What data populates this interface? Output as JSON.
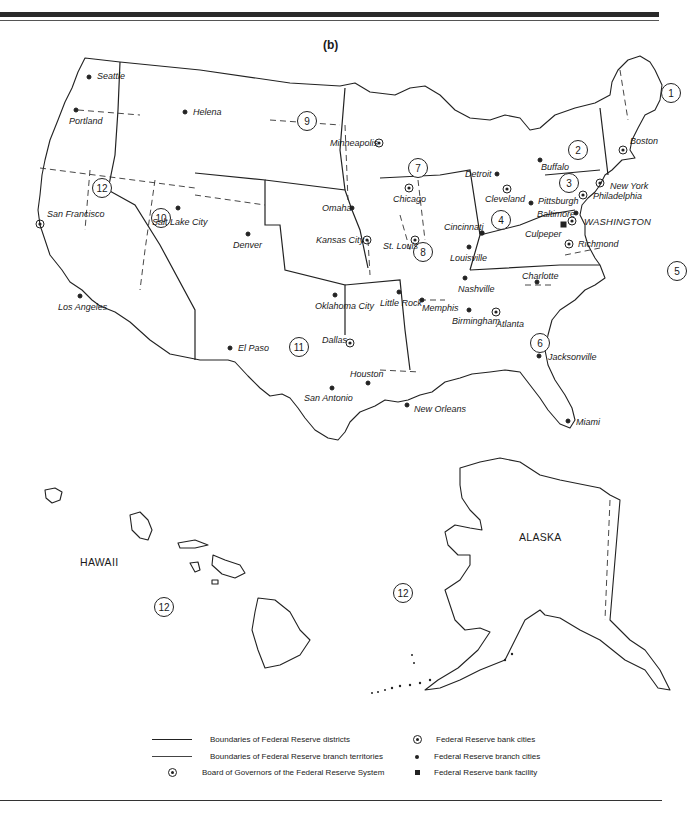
{
  "figure": {
    "subtitle": "(b)",
    "colors": {
      "ink": "#1a1a1a",
      "background": "#ffffff"
    }
  },
  "districts": [
    {
      "number": "1",
      "x": 671,
      "y": 93
    },
    {
      "number": "2",
      "x": 578,
      "y": 150
    },
    {
      "number": "3",
      "x": 567,
      "y": 183
    },
    {
      "number": "4",
      "x": 500,
      "y": 220
    },
    {
      "number": "5",
      "x": 678,
      "y": 271
    },
    {
      "number": "6",
      "x": 540,
      "y": 333
    },
    {
      "number": "7",
      "x": 407,
      "y": 168
    },
    {
      "number": "8",
      "x": 415,
      "y": 250
    },
    {
      "number": "9",
      "x": 301,
      "y": 121
    },
    {
      "number": "10",
      "x": 160,
      "y": 218
    },
    {
      "number": "11",
      "x": 288,
      "y": 347
    },
    {
      "number": "12",
      "x": 95,
      "y": 184
    },
    {
      "number": "12",
      "x": 155,
      "y": 602
    },
    {
      "number": "12",
      "x": 392,
      "y": 594
    }
  ],
  "cities": {
    "bank": [
      {
        "name": "Boston",
        "x": 623,
        "y": 150
      },
      {
        "name": "New York",
        "x": 600,
        "y": 183
      },
      {
        "name": "Philadelphia",
        "x": 583,
        "y": 195
      },
      {
        "name": "Cleveland",
        "x": 507,
        "y": 189
      },
      {
        "name": "Richmond",
        "x": 569,
        "y": 244
      },
      {
        "name": "Atlanta",
        "x": 496,
        "y": 312
      },
      {
        "name": "Chicago",
        "x": 409,
        "y": 188
      },
      {
        "name": "St. Louis",
        "x": 415,
        "y": 240
      },
      {
        "name": "Minneapolis",
        "x": 379,
        "y": 143
      },
      {
        "name": "Kansas City",
        "x": 367,
        "y": 240
      },
      {
        "name": "Dallas",
        "x": 350,
        "y": 343
      },
      {
        "name": "San Francisco",
        "x": 40,
        "y": 224
      }
    ],
    "branch": [
      {
        "name": "Seattle",
        "x": 89,
        "y": 77
      },
      {
        "name": "Portland",
        "x": 76,
        "y": 110
      },
      {
        "name": "Helena",
        "x": 185,
        "y": 112
      },
      {
        "name": "Salt Lake City",
        "x": 178,
        "y": 208
      },
      {
        "name": "Denver",
        "x": 248,
        "y": 234
      },
      {
        "name": "Los Angeles",
        "x": 80,
        "y": 296
      },
      {
        "name": "Omaha",
        "x": 352,
        "y": 208
      },
      {
        "name": "Oklahoma City",
        "x": 335,
        "y": 295
      },
      {
        "name": "El Paso",
        "x": 230,
        "y": 348
      },
      {
        "name": "San Antonio",
        "x": 330,
        "y": 388
      },
      {
        "name": "Houston",
        "x": 368,
        "y": 383
      },
      {
        "name": "Little Rock",
        "x": 399,
        "y": 292
      },
      {
        "name": "Memphis",
        "x": 422,
        "y": 300
      },
      {
        "name": "New Orleans",
        "x": 407,
        "y": 405
      },
      {
        "name": "Birmingham",
        "x": 469,
        "y": 310
      },
      {
        "name": "Nashville",
        "x": 465,
        "y": 278
      },
      {
        "name": "Louisville",
        "x": 469,
        "y": 247
      },
      {
        "name": "Cincinnati",
        "x": 481,
        "y": 232
      },
      {
        "name": "Detroit",
        "x": 497,
        "y": 174
      },
      {
        "name": "Buffalo",
        "x": 540,
        "y": 160
      },
      {
        "name": "Pittsburgh",
        "x": 531,
        "y": 203
      },
      {
        "name": "Baltimore",
        "x": 576,
        "y": 213
      },
      {
        "name": "Charlotte",
        "x": 537,
        "y": 282
      },
      {
        "name": "Jacksonville",
        "x": 539,
        "y": 356
      },
      {
        "name": "Miami",
        "x": 568,
        "y": 421
      }
    ],
    "facility": [
      {
        "name": "Culpeper",
        "x": 563,
        "y": 224
      }
    ],
    "board": [
      {
        "name": "WASHINGTON",
        "x": 572,
        "y": 221
      }
    ]
  },
  "labels": {
    "seattle": "Seattle",
    "portland": "Portland",
    "helena": "Helena",
    "san_francisco": "San Francisco",
    "salt_lake_city": "Salt Lake City",
    "denver": "Denver",
    "los_angeles": "Los Angeles",
    "minneapolis": "Minneapolis",
    "omaha": "Omaha",
    "kansas_city": "Kansas City",
    "oklahoma_city": "Oklahoma City",
    "el_paso": "El Paso",
    "dallas": "Dallas",
    "san_antonio": "San Antonio",
    "houston": "Houston",
    "chicago": "Chicago",
    "detroit": "Detroit",
    "st_louis": "St. Louis",
    "cincinnati": "Cincinnati",
    "louisville": "Louisville",
    "little_rock": "Little Rock",
    "memphis": "Memphis",
    "nashville": "Nashville",
    "new_orleans": "New Orleans",
    "birmingham": "Birmingham",
    "atlanta": "Atlanta",
    "jacksonville": "Jacksonville",
    "miami": "Miami",
    "charlotte": "Charlotte",
    "cleveland": "Cleveland",
    "pittsburgh": "Pittsburgh",
    "buffalo": "Buffalo",
    "boston": "Boston",
    "new_york": "New York",
    "philadelphia": "Philadelphia",
    "baltimore": "Baltimore",
    "washington": "WASHINGTON",
    "culpeper": "Culpeper",
    "richmond": "Richmond",
    "hawaii": "HAWAII",
    "alaska": "ALASKA"
  },
  "legend": {
    "items": [
      {
        "symbol": "thick-line",
        "label": "Boundaries of Federal Reserve districts"
      },
      {
        "symbol": "thin-line",
        "label": "Boundaries of Federal Reserve branch territories"
      },
      {
        "symbol": "circled-dot",
        "label": "Board of Governors of the Federal Reserve System"
      },
      {
        "symbol": "circled-dot",
        "label": "Federal Reserve bank cities"
      },
      {
        "symbol": "dot",
        "label": "Federal Reserve branch cities"
      },
      {
        "symbol": "square",
        "label": "Federal Reserve bank facility"
      }
    ]
  }
}
